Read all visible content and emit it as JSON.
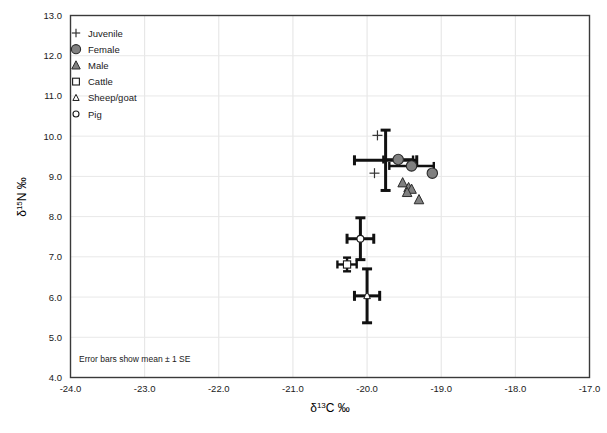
{
  "chart_data": {
    "type": "scatter",
    "title": "",
    "xlabel": "δ13C ‰",
    "ylabel": "δ15N ‰",
    "xlabel_parts": {
      "delta": "δ",
      "sup": "13",
      "rest": "C ‰"
    },
    "ylabel_parts": {
      "delta": "δ",
      "sup": "15",
      "rest": "N ‰"
    },
    "xlim": [
      -24.0,
      -17.0
    ],
    "ylim": [
      4.0,
      13.0
    ],
    "xticks": [
      -24.0,
      -23.0,
      -22.0,
      -21.0,
      -20.0,
      -19.0,
      -18.0,
      -17.0
    ],
    "xtick_labels": [
      "-24.0",
      "-23.0",
      "-22.0",
      "-21.0",
      "-20.0",
      "-19.0",
      "-18.0",
      "-17.0"
    ],
    "yticks": [
      4.0,
      5.0,
      6.0,
      7.0,
      8.0,
      9.0,
      10.0,
      11.0,
      12.0,
      13.0
    ],
    "ytick_labels": [
      "4.0",
      "5.0",
      "6.0",
      "7.0",
      "8.0",
      "9.0",
      "10.0",
      "11.0",
      "12.0",
      "13.0"
    ],
    "grid": true,
    "legend_position": "top-left",
    "annotation": "Error bars show mean ± 1 SE",
    "marker_fill_gray": "#808080",
    "series": [
      {
        "name": "Juvenile",
        "marker": "plus",
        "filled": false,
        "points": [
          {
            "x": -19.86,
            "y": 10.02
          },
          {
            "x": -19.9,
            "y": 9.08
          }
        ]
      },
      {
        "name": "Female",
        "marker": "circle",
        "filled": true,
        "points": [
          {
            "x": -19.58,
            "y": 9.42
          },
          {
            "x": -19.4,
            "y": 9.26
          },
          {
            "x": -19.12,
            "y": 9.08
          }
        ],
        "error_bars": [
          {
            "x": -19.75,
            "y": 9.4,
            "xerr": 0.42,
            "yerr": 0.75
          },
          {
            "x": -19.58,
            "y": 9.42,
            "xerr": 0.2,
            "yerr": 0.0
          },
          {
            "x": -19.4,
            "y": 9.26,
            "xerr": 0.3,
            "yerr": 0.0
          }
        ]
      },
      {
        "name": "Male",
        "marker": "triangle",
        "filled": true,
        "points": [
          {
            "x": -19.52,
            "y": 8.84
          },
          {
            "x": -19.44,
            "y": 8.72
          },
          {
            "x": -19.4,
            "y": 8.68
          },
          {
            "x": -19.46,
            "y": 8.6
          },
          {
            "x": -19.3,
            "y": 8.42
          }
        ]
      },
      {
        "name": "Cattle",
        "marker": "square",
        "filled": false,
        "points": [
          {
            "x": -20.27,
            "y": 6.81
          }
        ],
        "error_bars": [
          {
            "x": -20.27,
            "y": 6.81,
            "xerr": 0.13,
            "yerr": 0.17
          }
        ]
      },
      {
        "name": "Sheep/goat",
        "marker": "triangle-open",
        "filled": false,
        "points": [
          {
            "x": -20.0,
            "y": 6.03
          }
        ],
        "error_bars": [
          {
            "x": -20.0,
            "y": 6.03,
            "xerr": 0.17,
            "yerr": 0.67
          }
        ]
      },
      {
        "name": "Pig",
        "marker": "circle-open",
        "filled": false,
        "points": [
          {
            "x": -20.09,
            "y": 7.45
          }
        ],
        "error_bars": [
          {
            "x": -20.09,
            "y": 7.45,
            "xerr": 0.18,
            "yerr": 0.52
          }
        ]
      }
    ],
    "legend_entries": [
      {
        "label": "Juvenile",
        "marker": "plus"
      },
      {
        "label": "Female",
        "marker": "circle"
      },
      {
        "label": "Male",
        "marker": "triangle"
      },
      {
        "label": "Cattle",
        "marker": "square"
      },
      {
        "label": "Sheep/goat",
        "marker": "triangle-open"
      },
      {
        "label": "Pig",
        "marker": "circle-open"
      }
    ]
  }
}
